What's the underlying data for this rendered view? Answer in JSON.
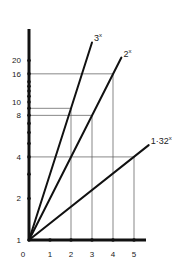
{
  "chart_data": {
    "type": "line",
    "title": "",
    "xlabel": "",
    "ylabel": "",
    "yscale": "log",
    "xlim": [
      0,
      5.6
    ],
    "ylim": [
      1,
      24
    ],
    "grid": false,
    "x_ticks": [
      0,
      1,
      2,
      3,
      4,
      5
    ],
    "x_tick_labels": [
      "0",
      "1",
      "2",
      "3",
      "4",
      "5"
    ],
    "y_ticks": [
      1,
      2,
      3,
      4,
      5,
      6,
      7,
      8,
      9,
      10,
      11,
      12,
      13,
      14,
      16,
      20
    ],
    "y_tick_labels": [
      {
        "value": 1,
        "label": "1"
      },
      {
        "value": 2,
        "label": "2"
      },
      {
        "value": 4,
        "label": "4"
      },
      {
        "value": 8,
        "label": "8"
      },
      {
        "value": 10,
        "label": "10"
      },
      {
        "value": 16,
        "label": "16"
      },
      {
        "value": 20,
        "label": "20"
      }
    ],
    "series": [
      {
        "name": "3^x",
        "label_base": "3",
        "label_exp": "x",
        "x": [
          0,
          3.0
        ],
        "y": [
          1,
          27
        ]
      },
      {
        "name": "2^x",
        "label_base": "2",
        "label_exp": "x",
        "x": [
          0,
          4.4
        ],
        "y": [
          1,
          21
        ]
      },
      {
        "name": "1·32^x",
        "label_base": "1·32",
        "label_exp": "x",
        "x": [
          0,
          5.7
        ],
        "y": [
          1,
          4.87
        ]
      }
    ],
    "guides": [
      {
        "series": "3^x",
        "x": 2,
        "y": 9
      },
      {
        "series": "2^x",
        "x": 3,
        "y": 8
      },
      {
        "series": "2^x",
        "x": 4,
        "y": 16
      },
      {
        "series": "1·32^x",
        "x": 5,
        "y": 4
      }
    ]
  }
}
